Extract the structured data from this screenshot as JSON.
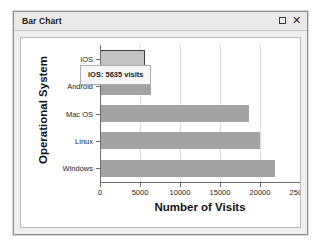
{
  "window": {
    "title": "Bar Chart",
    "controls": [
      {
        "name": "maximize",
        "glyph": "□"
      },
      {
        "name": "close",
        "glyph": "✕"
      }
    ]
  },
  "tooltip": {
    "text": "iOS: 5635 visits",
    "visible": true
  },
  "colors": {
    "bar": "#a3a3a3",
    "bar_highlight": "#c3c3c3",
    "bar_highlight_border": "#3f3f3f",
    "grid": "#dcdcdc",
    "axis": "#6e6e6e",
    "panel_background": "#ffffff",
    "window_background": "#f0efee",
    "titlebar_background": "#eceae8"
  },
  "chart_data": {
    "type": "bar",
    "orientation": "horizontal",
    "title": "",
    "xlabel": "Number of Visits",
    "ylabel": "Operational System",
    "categories": [
      "iOS",
      "Android",
      "Mac OS",
      "Linux",
      "Windows"
    ],
    "values": [
      5635,
      6400,
      18600,
      20000,
      21900
    ],
    "xlim": [
      0,
      25000
    ],
    "xticks": [
      0,
      5000,
      10000,
      15000,
      20000,
      25000
    ],
    "xtick_labels": [
      "0",
      "5000",
      "10000",
      "15000",
      "20000",
      "25000"
    ],
    "grid": true,
    "grid_axis": "x",
    "legend": false,
    "highlighted_category": "iOS",
    "annotations": [
      {
        "text": "iOS: 5635 visits",
        "attached_to": "iOS"
      }
    ]
  }
}
